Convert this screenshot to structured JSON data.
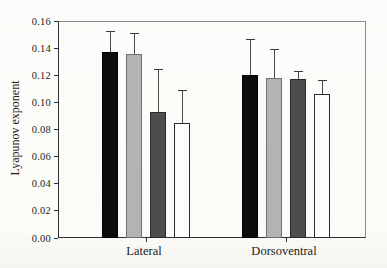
{
  "figure": {
    "background_color": "#fbfbf8",
    "frame_color_dark": "#2e2e2e",
    "frame_color_light": "#8d8d8d"
  },
  "chart_data": {
    "type": "bar",
    "title": "",
    "xlabel": "",
    "ylabel": "Lyapunov exponent",
    "ylim": [
      0,
      0.16
    ],
    "ytick_labels": [
      "0.00",
      "0.02",
      "0.04",
      "0.06",
      "0.08",
      "0.10",
      "0.12",
      "0.14",
      "0.16"
    ],
    "categories": [
      "Lateral",
      "Dorsoventral"
    ],
    "series": [
      {
        "name": "black-bar-series",
        "fill": "#0d0d0d",
        "edge": "#000000",
        "values": [
          0.137,
          0.12
        ],
        "errors_upper": [
          0.015,
          0.026
        ]
      },
      {
        "name": "light-gray-bar-series",
        "fill": "#b3b3b3",
        "edge": "#6e6e6e",
        "values": [
          0.136,
          0.118
        ],
        "errors_upper": [
          0.015,
          0.021
        ]
      },
      {
        "name": "dark-gray-bar-series",
        "fill": "#4d4d4d",
        "edge": "#2b2b2b",
        "values": [
          0.093,
          0.117
        ],
        "errors_upper": [
          0.031,
          0.006
        ]
      },
      {
        "name": "white-bar-series",
        "fill": "#fdfdfd",
        "edge": "#2b2b2b",
        "values": [
          0.085,
          0.106
        ],
        "errors_upper": [
          0.024,
          0.01
        ]
      }
    ],
    "error_bars": "upper-only",
    "grid": false,
    "legend": "none"
  }
}
